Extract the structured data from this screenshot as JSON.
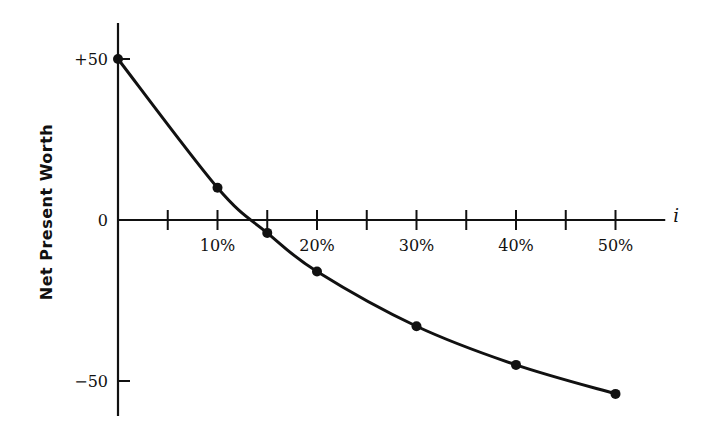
{
  "chart_data": {
    "type": "line",
    "title": "",
    "xlabel": "i",
    "ylabel": "Net Present Worth",
    "x_unit": "%",
    "xlim": [
      0,
      55
    ],
    "ylim": [
      -60,
      62
    ],
    "x_minor_ticks": [
      5,
      10,
      15,
      20,
      25,
      30,
      35,
      40,
      45,
      50
    ],
    "x_tick_labels": [
      {
        "x": 10,
        "label": "10%"
      },
      {
        "x": 20,
        "label": "20%"
      },
      {
        "x": 30,
        "label": "30%"
      },
      {
        "x": 40,
        "label": "40%"
      },
      {
        "x": 50,
        "label": "50%"
      }
    ],
    "y_ticks": [
      {
        "y": 50,
        "label": "+50"
      },
      {
        "y": 0,
        "label": "0"
      },
      {
        "y": -50,
        "label": "−50"
      }
    ],
    "grid": false,
    "legend": "none",
    "series": [
      {
        "name": "Net Present Worth",
        "points": [
          {
            "x": 0,
            "y": 50
          },
          {
            "x": 10,
            "y": 10
          },
          {
            "x": 15,
            "y": -4
          },
          {
            "x": 20,
            "y": -16
          },
          {
            "x": 30,
            "y": -33
          },
          {
            "x": 40,
            "y": -45
          },
          {
            "x": 50,
            "y": -54
          }
        ]
      }
    ]
  }
}
